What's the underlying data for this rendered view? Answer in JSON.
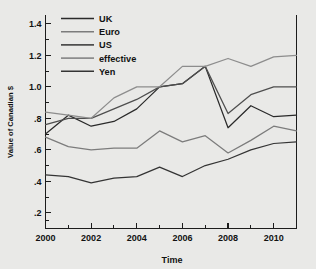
{
  "chart_data": {
    "type": "line",
    "title": "",
    "xlabel": "Time",
    "ylabel": "Value of Canadian $",
    "x": [
      2000,
      2001,
      2002,
      2003,
      2004,
      2005,
      2006,
      2007,
      2008,
      2009,
      2010,
      2011
    ],
    "xlim": [
      2000,
      2011
    ],
    "ylim": [
      0.1,
      1.45
    ],
    "grid": false,
    "legend_position": "top-left-inside",
    "x_tick_labels": [
      "2000",
      "2002",
      "2004",
      "2006",
      "2008",
      "2010"
    ],
    "x_tick_values": [
      2000,
      2002,
      2004,
      2006,
      2008,
      2010
    ],
    "x_minor_ticks": [
      2001,
      2003,
      2005,
      2007,
      2009,
      2011
    ],
    "y_tick_labels": [
      "1.4",
      "1.2",
      "1.0",
      ".8",
      ".6",
      ".4",
      ".2"
    ],
    "y_tick_values": [
      1.4,
      1.2,
      1.0,
      0.8,
      0.6,
      0.4,
      0.2
    ],
    "y_minor_ticks": [
      1.3,
      1.1,
      0.9,
      0.7,
      0.5,
      0.3,
      0.15
    ],
    "series": [
      {
        "name": "UK",
        "color": "#2a2a2a",
        "values": [
          0.7,
          0.82,
          0.75,
          0.78,
          0.86,
          1.0,
          1.02,
          1.13,
          0.74,
          0.88,
          0.81,
          0.82
        ]
      },
      {
        "name": "Euro",
        "color": "#7c7c7c",
        "values": [
          0.68,
          0.62,
          0.6,
          0.61,
          0.61,
          0.72,
          0.65,
          0.69,
          0.58,
          0.66,
          0.75,
          0.72
        ]
      },
      {
        "name": "US",
        "color": "#4e4e4e",
        "values": [
          0.76,
          0.8,
          0.8,
          0.86,
          0.92,
          1.0,
          1.02,
          1.13,
          0.83,
          0.95,
          1.0,
          1.0
        ]
      },
      {
        "name": "effective",
        "color": "#8d8d8d",
        "values": [
          0.84,
          0.82,
          0.8,
          0.93,
          1.0,
          1.0,
          1.13,
          1.13,
          1.18,
          1.13,
          1.19,
          1.2
        ]
      },
      {
        "name": "Yen",
        "color": "#343434",
        "values": [
          0.44,
          0.43,
          0.39,
          0.42,
          0.43,
          0.49,
          0.43,
          0.5,
          0.54,
          0.6,
          0.64,
          0.65
        ]
      }
    ]
  },
  "legend": {
    "items": [
      {
        "label": "UK"
      },
      {
        "label": "Euro"
      },
      {
        "label": "US"
      },
      {
        "label": "effective"
      },
      {
        "label": "Yen"
      }
    ]
  },
  "axes": {
    "y_title": "Value of Canadian $",
    "x_title": "Time"
  },
  "colors": {
    "background": "#e9e9e7",
    "axis": "#1c1c1c",
    "text": "#121212"
  }
}
